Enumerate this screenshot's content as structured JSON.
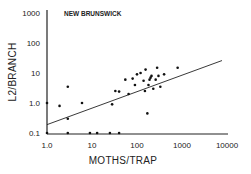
{
  "chart_data": {
    "type": "scatter",
    "title": "NEW BRUNSWICK",
    "xlabel": "MOTHS/TRAP",
    "ylabel": "L2/BRANCH",
    "xscale": "log",
    "yscale": "log",
    "xlim": [
      1.0,
      10000
    ],
    "ylim": [
      0.1,
      1000
    ],
    "x_ticks": [
      "1.0",
      "10",
      "100",
      "1000",
      "10000"
    ],
    "y_ticks": [
      "0.1",
      "1.0",
      "10",
      "100",
      "1000"
    ],
    "grid": false,
    "legend": null,
    "points": [
      {
        "x": 1.0,
        "y": 1.0
      },
      {
        "x": 1.0,
        "y": 0.1
      },
      {
        "x": 1.9,
        "y": 0.8
      },
      {
        "x": 2.9,
        "y": 3.5
      },
      {
        "x": 2.9,
        "y": 0.3
      },
      {
        "x": 2.9,
        "y": 0.1
      },
      {
        "x": 6.0,
        "y": 1.0
      },
      {
        "x": 9.0,
        "y": 0.1
      },
      {
        "x": 13.0,
        "y": 0.1
      },
      {
        "x": 25.0,
        "y": 0.1
      },
      {
        "x": 40.0,
        "y": 0.1
      },
      {
        "x": 28.0,
        "y": 0.9
      },
      {
        "x": 33.0,
        "y": 2.5
      },
      {
        "x": 40.0,
        "y": 2.4
      },
      {
        "x": 55.0,
        "y": 6.0
      },
      {
        "x": 65.0,
        "y": 2.0
      },
      {
        "x": 80.0,
        "y": 6.5
      },
      {
        "x": 90.0,
        "y": 4.0
      },
      {
        "x": 100.0,
        "y": 9.0
      },
      {
        "x": 120.0,
        "y": 10.0
      },
      {
        "x": 140.0,
        "y": 5.5
      },
      {
        "x": 150.0,
        "y": 2.5
      },
      {
        "x": 155.0,
        "y": 13.0
      },
      {
        "x": 170.0,
        "y": 0.45
      },
      {
        "x": 180.0,
        "y": 4.0
      },
      {
        "x": 190.0,
        "y": 6.0
      },
      {
        "x": 200.0,
        "y": 7.0
      },
      {
        "x": 210.0,
        "y": 8.0
      },
      {
        "x": 230.0,
        "y": 3.0
      },
      {
        "x": 260.0,
        "y": 6.0
      },
      {
        "x": 280.0,
        "y": 15.0
      },
      {
        "x": 300.0,
        "y": 8.0
      },
      {
        "x": 330.0,
        "y": 3.5
      },
      {
        "x": 400.0,
        "y": 9.0
      },
      {
        "x": 800.0,
        "y": 15.0
      }
    ],
    "regression_line": {
      "x": [
        1.0,
        10000
      ],
      "y": [
        0.19,
        26
      ]
    }
  }
}
